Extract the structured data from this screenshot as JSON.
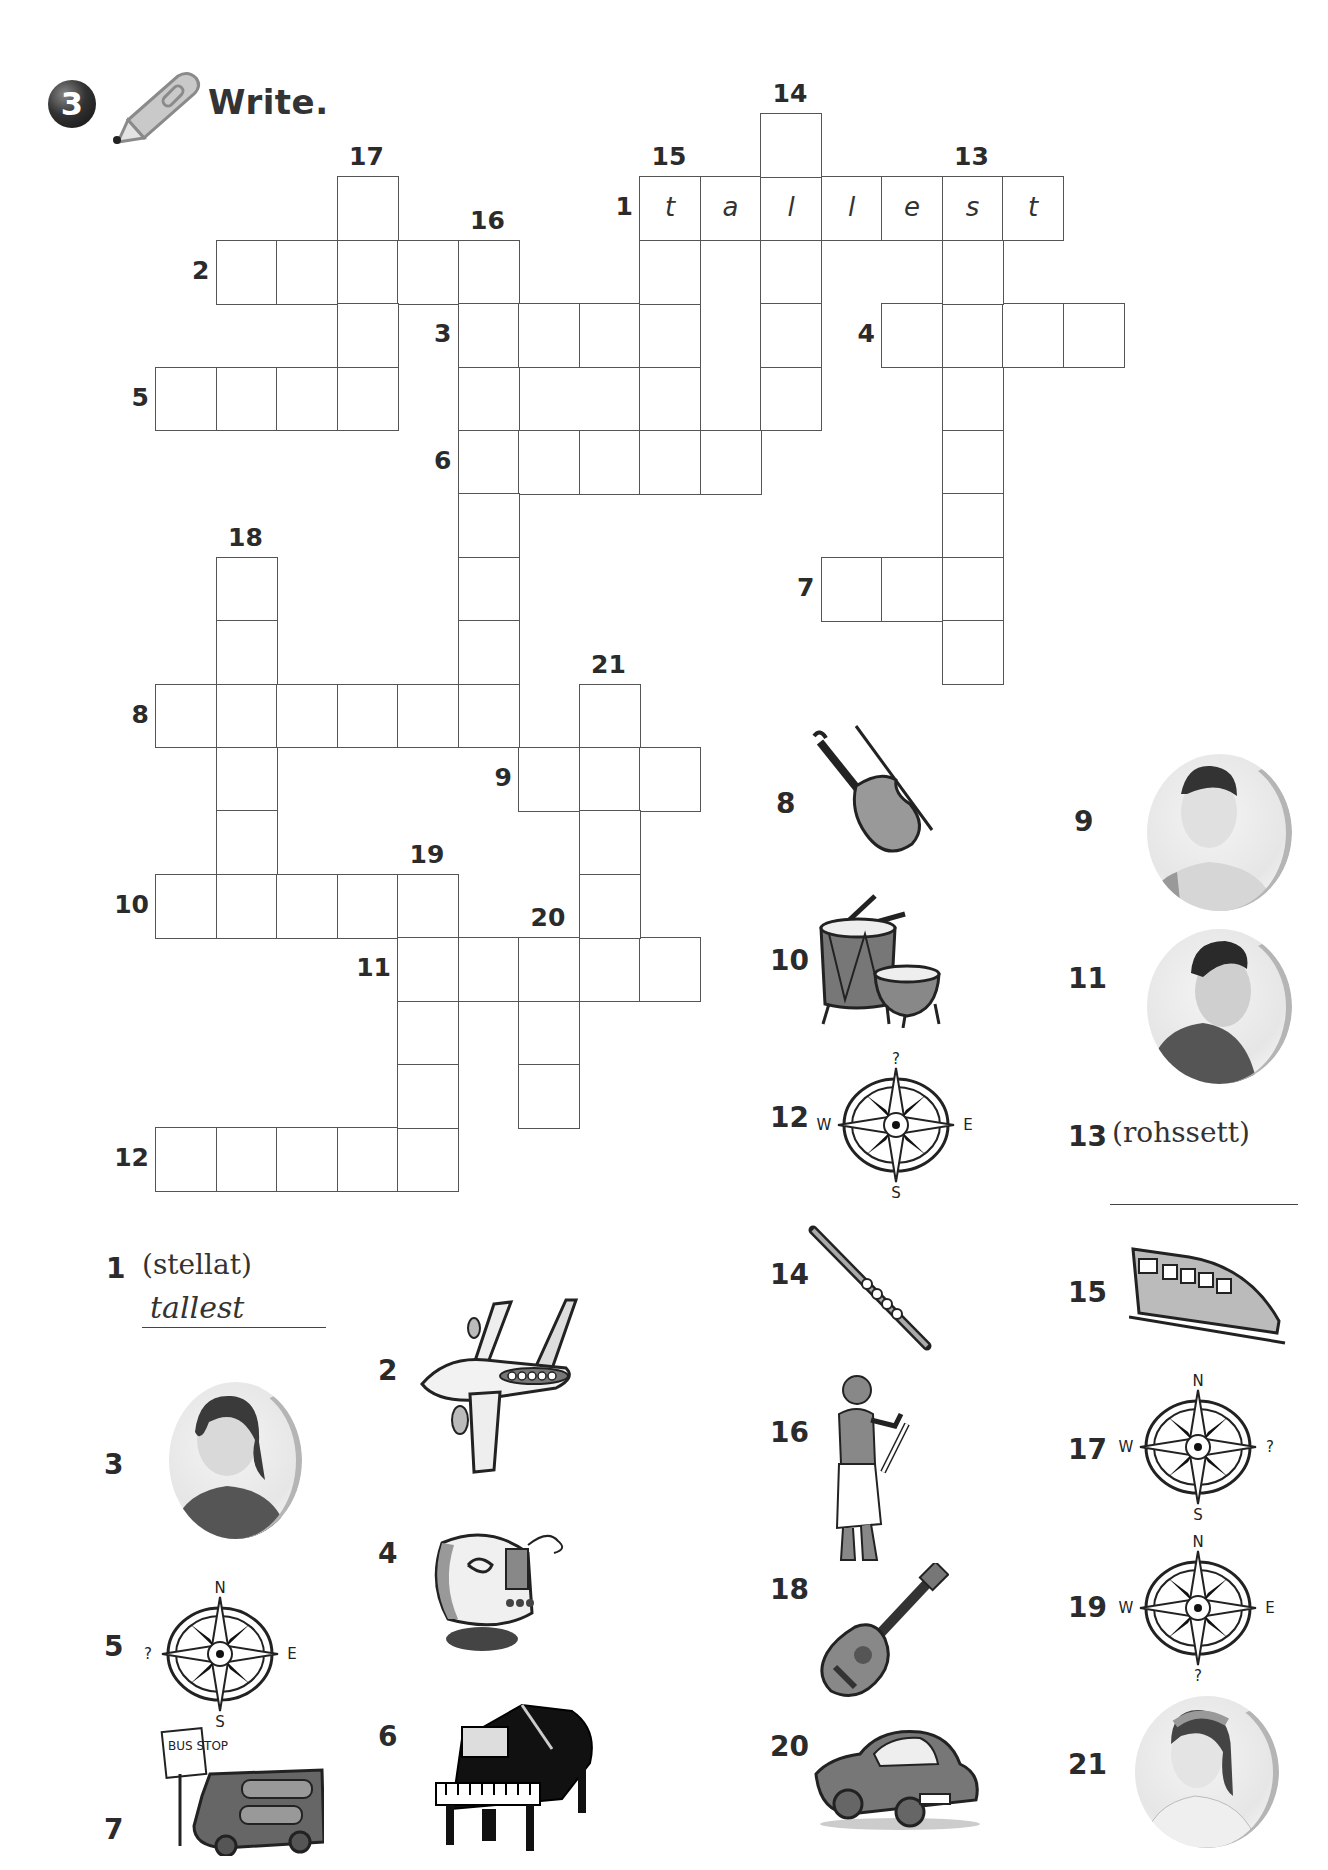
{
  "header": {
    "exercise_number": "3",
    "instruction": "Write.",
    "icons": [
      "number-badge",
      "pencil-icon"
    ]
  },
  "grid": {
    "origin": {
      "x": 155,
      "y": 113
    },
    "cell_w": 60.5,
    "cell_h": 63.4,
    "across": [
      {
        "n": "1",
        "row": 1,
        "col": 8,
        "len": 7,
        "letters": [
          "t",
          "a",
          "l",
          "l",
          "e",
          "s",
          "t"
        ]
      },
      {
        "n": "2",
        "row": 2,
        "col": 1,
        "len": 5
      },
      {
        "n": "3",
        "row": 3,
        "col": 5,
        "len": 4
      },
      {
        "n": "4",
        "row": 3,
        "col": 12,
        "len": 4
      },
      {
        "n": "5",
        "row": 4,
        "col": 0,
        "len": 4
      },
      {
        "n": "6",
        "row": 5,
        "col": 5,
        "len": 5
      },
      {
        "n": "7",
        "row": 7,
        "col": 11,
        "len": 3
      },
      {
        "n": "8",
        "row": 9,
        "col": 0,
        "len": 6
      },
      {
        "n": "9",
        "row": 10,
        "col": 6,
        "len": 3
      },
      {
        "n": "10",
        "row": 12,
        "col": 0,
        "len": 5
      },
      {
        "n": "11",
        "row": 13,
        "col": 4,
        "len": 5
      },
      {
        "n": "12",
        "row": 16,
        "col": 0,
        "len": 5
      }
    ],
    "down": [
      {
        "n": "13",
        "row": 1,
        "col": 13,
        "len": 8
      },
      {
        "n": "14",
        "row": 0,
        "col": 10,
        "len": 5
      },
      {
        "n": "15",
        "row": 1,
        "col": 8,
        "len": 5
      },
      {
        "n": "16",
        "row": 2,
        "col": 5,
        "len": 8
      },
      {
        "n": "17",
        "row": 1,
        "col": 3,
        "len": 4
      },
      {
        "n": "18",
        "row": 7,
        "col": 1,
        "len": 6
      },
      {
        "n": "19",
        "row": 12,
        "col": 4,
        "len": 5
      },
      {
        "n": "20",
        "row": 13,
        "col": 6,
        "len": 3
      },
      {
        "n": "21",
        "row": 9,
        "col": 7,
        "len": 5
      }
    ]
  },
  "clues": {
    "c1": {
      "number": "1",
      "scrambled": "(stellat)",
      "answer": "tallest"
    },
    "c2": {
      "number": "2",
      "picture": "airplane"
    },
    "c3": {
      "number": "3",
      "picture": "girl-photo"
    },
    "c4": {
      "number": "4",
      "picture": "ship-on-map"
    },
    "c5": {
      "number": "5",
      "picture": "compass-west",
      "compass": {
        "n": "N",
        "e": "E",
        "s": "S",
        "w": "?"
      }
    },
    "c6": {
      "number": "6",
      "picture": "grand-piano"
    },
    "c7": {
      "number": "7",
      "picture": "bus-at-stop",
      "sign": "BUS STOP"
    },
    "c8": {
      "number": "8",
      "picture": "violin"
    },
    "c9": {
      "number": "9",
      "picture": "boy-photo"
    },
    "c10": {
      "number": "10",
      "picture": "drums"
    },
    "c11": {
      "number": "11",
      "picture": "boy-photo"
    },
    "c12": {
      "number": "12",
      "picture": "compass-north",
      "compass": {
        "n": "?",
        "e": "E",
        "s": "S",
        "w": "W"
      }
    },
    "c13": {
      "number": "13",
      "scrambled": "(rohssett)",
      "answer": ""
    },
    "c14": {
      "number": "14",
      "picture": "flute"
    },
    "c15": {
      "number": "15",
      "picture": "train"
    },
    "c16": {
      "number": "16",
      "picture": "egyptian-scribe"
    },
    "c17": {
      "number": "17",
      "picture": "compass-east",
      "compass": {
        "n": "N",
        "e": "?",
        "s": "S",
        "w": "W"
      }
    },
    "c18": {
      "number": "18",
      "picture": "guitar"
    },
    "c19": {
      "number": "19",
      "picture": "compass-south",
      "compass": {
        "n": "N",
        "e": "E",
        "s": "?",
        "w": "W"
      }
    },
    "c20": {
      "number": "20",
      "picture": "car"
    },
    "c21": {
      "number": "21",
      "picture": "girl-photo"
    }
  },
  "colors": {
    "ink": "#2b2b2b",
    "grid_line": "#555555",
    "photo_ring": "#b5b5b5"
  }
}
